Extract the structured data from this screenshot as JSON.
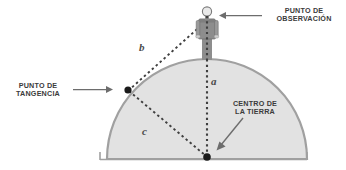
{
  "diagram": {
    "labels": {
      "observacion": "PUNTO DE\nOBSERVACIÓN",
      "tangencia": "PUNTO DE\nTANGENCIA",
      "centro": "CENTRO DE\nLA TIERRA",
      "segment_a": "a",
      "segment_b": "b",
      "segment_c": "c"
    },
    "colors": {
      "earth_fill": "#e2e2e2",
      "earth_stroke": "#9c9c9c",
      "ground_line": "#9c9c9c",
      "dashed_line": "#3f3f3f",
      "point_dot": "#1a1a1a",
      "arrow": "#6d6d6d",
      "figure_body": "#8f8f8f",
      "figure_outline": "#6b6b6b",
      "text": "#3b3b3b",
      "math_text": "#4a4a4a"
    },
    "geometry": {
      "earth_center": {
        "x": 207,
        "y": 157
      },
      "earth_radius": 100,
      "tangency_point": {
        "x": 128,
        "y": 90
      },
      "observer_point": {
        "x": 207,
        "y": 18
      },
      "baseline_y": 159,
      "baseline_x_start": 100,
      "baseline_x_end": 307
    },
    "elements": {
      "earth_dome": "earth-dome",
      "observer_figure": "observer-figure",
      "segment_a_line": "radius-plus-height-line",
      "segment_b_line": "tangent-line",
      "segment_c_line": "earth-radius-line",
      "arrow_observacion": "arrow-to-observer",
      "arrow_tangencia": "arrow-to-tangency",
      "arrow_centro": "arrow-to-center"
    }
  }
}
